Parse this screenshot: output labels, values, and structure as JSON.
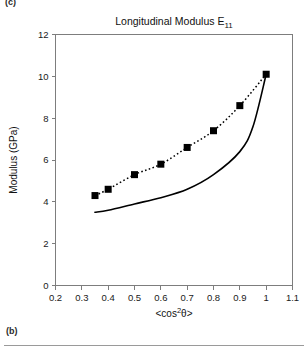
{
  "panel_labels": {
    "top": "(c)",
    "bottom": "(b)"
  },
  "chart_data": {
    "type": "scatter",
    "title": "Longitudinal Modulus E11",
    "title_main": "Longitudinal Modulus E",
    "title_subscript": "11",
    "xlabel": "<cos2θ>",
    "xlabel_main_open": "<cos",
    "xlabel_superscript": "2",
    "xlabel_main_close": "θ>",
    "ylabel": "Modulus (GPa)",
    "xlim": [
      0.2,
      1.1
    ],
    "ylim": [
      0,
      12
    ],
    "xticks": [
      "0.2",
      "0.3",
      "0.4",
      "0.5",
      "0.6",
      "0.7",
      "0.8",
      "0.9",
      "1",
      "1.1"
    ],
    "xtick_values": [
      0.2,
      0.3,
      0.4,
      0.5,
      0.6,
      0.7,
      0.8,
      0.9,
      1.0,
      1.1
    ],
    "yticks": [
      "0",
      "2",
      "4",
      "6",
      "8",
      "10",
      "12"
    ],
    "ytick_values": [
      0,
      2,
      4,
      6,
      8,
      10,
      12
    ],
    "grid": false,
    "legend": "none",
    "series": [
      {
        "name": "measured-modulus",
        "style": "dotted-line-with-square-markers",
        "marker": "filled-square",
        "color": "#000000",
        "x": [
          0.35,
          0.4,
          0.5,
          0.6,
          0.7,
          0.8,
          0.9,
          1.0
        ],
        "values": [
          4.3,
          4.6,
          5.3,
          5.8,
          6.6,
          7.4,
          8.6,
          10.1
        ]
      },
      {
        "name": "model-prediction",
        "style": "solid-line",
        "marker": "none",
        "color": "#000000",
        "x": [
          0.35,
          0.4,
          0.5,
          0.6,
          0.7,
          0.8,
          0.9,
          0.95,
          1.0
        ],
        "values": [
          3.5,
          3.6,
          3.9,
          4.2,
          4.6,
          5.3,
          6.4,
          7.6,
          10.1
        ]
      }
    ]
  }
}
